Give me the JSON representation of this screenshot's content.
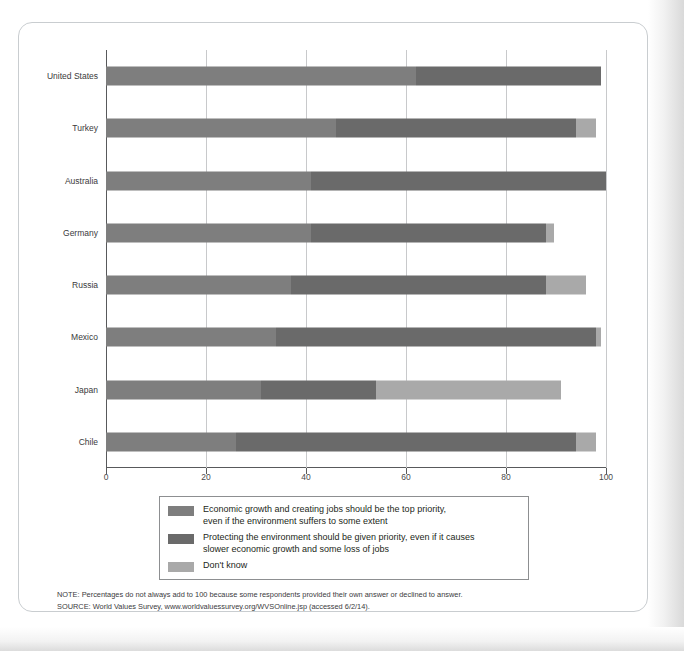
{
  "chart_data": {
    "type": "bar",
    "orientation": "horizontal",
    "stacked": true,
    "title": "",
    "xlabel": "",
    "ylabel": "",
    "xlim": [
      0,
      100
    ],
    "xticks": [
      0,
      20,
      40,
      60,
      80,
      100
    ],
    "xtick_labels": [
      "0",
      "20",
      "40",
      "60",
      "80",
      "100"
    ],
    "grid": "vertical",
    "categories": [
      "United States",
      "Turkey",
      "Australia",
      "Germany",
      "Russia",
      "Mexico",
      "Japan",
      "Chile"
    ],
    "series": [
      {
        "name": "Economic growth and creating jobs should be the top priority, even if the environment suffers to some extent",
        "short_name": "Economic growth",
        "color": "#7e7e7e",
        "values": [
          62,
          46,
          41,
          41,
          37,
          34,
          31,
          26
        ]
      },
      {
        "name": "Protecting the environment should be given priority, even if it causes slower economic growth and some loss of jobs",
        "short_name": "Protect environment",
        "color": "#6a6a6a",
        "values": [
          37,
          48,
          59,
          47,
          51,
          64,
          23,
          68
        ]
      },
      {
        "name": "Don't know",
        "short_name": "Don't know",
        "color": "#a9a9a9",
        "values": [
          0,
          4,
          0,
          1.5,
          8,
          1,
          37,
          4
        ]
      }
    ],
    "legend_position": "below-plot"
  },
  "legend": {
    "items": [
      {
        "swatch": "s1",
        "line1": "Economic growth and creating jobs should be the top priority,",
        "line2": "even if the environment suffers to some extent"
      },
      {
        "swatch": "s2",
        "line1": "Protecting the environment should be given priority, even if it causes",
        "line2": "slower economic growth and some loss of jobs"
      },
      {
        "swatch": "s3",
        "line1": "Don't know",
        "line2": ""
      }
    ]
  },
  "notes": {
    "note": "NOTE: Percentages do not always add to 100 because some respondents provided their own answer or declined to answer.",
    "source": "SOURCE: World Values Survey, www.worldvaluessurvey.org/WVSOnline.jsp (accessed 6/2/14)."
  }
}
